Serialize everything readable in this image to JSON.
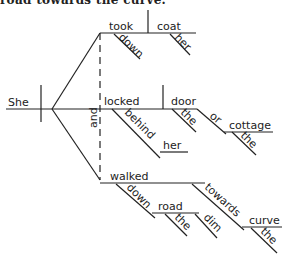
{
  "caption": "road towards the curve.",
  "diagram": {
    "type": "sentence-diagram",
    "subject": "She",
    "conjunction": "and",
    "predicates": [
      {
        "verb": "took",
        "modifiers": [
          "down"
        ],
        "object": "coat",
        "object_modifiers": [
          "her"
        ]
      },
      {
        "verb": "locked",
        "prepositional_phrase": {
          "preposition": "behind",
          "object": "her"
        },
        "objects": [
          {
            "word": "door",
            "modifiers": [
              "the"
            ]
          },
          {
            "word": "cottage",
            "modifiers": [
              "the"
            ]
          }
        ],
        "object_conjunction": "or"
      },
      {
        "verb": "walked",
        "prepositional_phrases": [
          {
            "preposition": "down",
            "object": "road",
            "modifiers": [
              "the",
              "dim"
            ]
          },
          {
            "preposition": "towards",
            "object": "curve",
            "modifiers": [
              "the"
            ]
          }
        ]
      }
    ]
  }
}
